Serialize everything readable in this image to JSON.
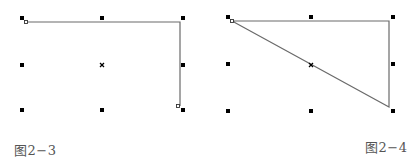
{
  "figures": [
    {
      "caption": "图2−3",
      "grid_points": [
        {
          "x": 22,
          "y": 18,
          "type": "square"
        },
        {
          "x": 102,
          "y": 18,
          "type": "square"
        },
        {
          "x": 183,
          "y": 18,
          "type": "square"
        },
        {
          "x": 22,
          "y": 65,
          "type": "square"
        },
        {
          "x": 102,
          "y": 65,
          "type": "cross"
        },
        {
          "x": 183,
          "y": 65,
          "type": "square"
        },
        {
          "x": 22,
          "y": 110,
          "type": "square"
        },
        {
          "x": 102,
          "y": 110,
          "type": "square"
        },
        {
          "x": 183,
          "y": 110,
          "type": "square"
        }
      ],
      "path": [
        [
          26,
          22
        ],
        [
          180,
          22
        ],
        [
          180,
          106
        ]
      ],
      "path_closed": false,
      "handles": [
        {
          "x": 26,
          "y": 22
        },
        {
          "x": 178,
          "y": 106
        }
      ]
    },
    {
      "caption": "图2−4",
      "grid_points": [
        {
          "x": 22,
          "y": 17,
          "type": "square"
        },
        {
          "x": 105,
          "y": 17,
          "type": "square"
        },
        {
          "x": 187,
          "y": 17,
          "type": "square"
        },
        {
          "x": 22,
          "y": 64,
          "type": "square"
        },
        {
          "x": 105,
          "y": 65,
          "type": "cross"
        },
        {
          "x": 187,
          "y": 64,
          "type": "square"
        },
        {
          "x": 22,
          "y": 111,
          "type": "square"
        },
        {
          "x": 105,
          "y": 111,
          "type": "square"
        },
        {
          "x": 187,
          "y": 111,
          "type": "square"
        }
      ],
      "path": [
        [
          26,
          21
        ],
        [
          183,
          21
        ],
        [
          183,
          107
        ],
        [
          26,
          21
        ]
      ],
      "path_closed": true,
      "handles": [
        {
          "x": 26,
          "y": 21
        }
      ]
    }
  ],
  "colors": {
    "dot": "#000000",
    "line": "#6a6a6a",
    "caption": "#555555"
  }
}
